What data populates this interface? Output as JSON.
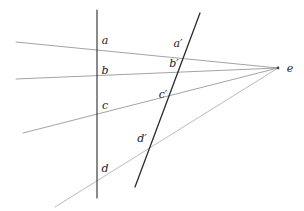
{
  "figure": {
    "background_color": "#ffffff",
    "width": 304,
    "height": 211,
    "ray_color": "#8c8c8c",
    "transversal_color": "#2b2b2b",
    "label_color": "#1a1a1a"
  },
  "vanishing_point": {
    "name": "e",
    "label": "e",
    "x": 278,
    "y": 68,
    "label_x": 290,
    "label_y": 68
  },
  "transversals": [
    {
      "name": "vertical-transversal",
      "x1": 97,
      "y1": 10,
      "x2": 97,
      "y2": 198,
      "color": "#2b2b2b",
      "width": 1.1
    },
    {
      "name": "oblique-transversal",
      "x1": 200,
      "y1": 13,
      "x2": 135,
      "y2": 187,
      "color": "#2b2b2b",
      "width": 1.3
    }
  ],
  "rays": [
    {
      "name": "ray-a",
      "x1": 16,
      "y1": 42,
      "x2": 278,
      "y2": 68,
      "color": "#8c8c8c",
      "width": 0.8
    },
    {
      "name": "ray-b",
      "x1": 16,
      "y1": 79,
      "x2": 278,
      "y2": 68,
      "color": "#8c8c8c",
      "width": 0.8
    },
    {
      "name": "ray-c",
      "x1": 23,
      "y1": 133,
      "x2": 278,
      "y2": 68,
      "color": "#8c8c8c",
      "width": 0.8
    },
    {
      "name": "ray-d",
      "x1": 55,
      "y1": 207,
      "x2": 278,
      "y2": 68,
      "color": "#a8a8a8",
      "width": 0.8
    }
  ],
  "labels": [
    {
      "name": "label-a",
      "text": "a",
      "x": 105,
      "y": 40
    },
    {
      "name": "label-b",
      "text": "b",
      "x": 105,
      "y": 70
    },
    {
      "name": "label-c",
      "text": "c",
      "x": 105,
      "y": 105
    },
    {
      "name": "label-d",
      "text": "d",
      "x": 105,
      "y": 168
    },
    {
      "name": "label-a-prime",
      "text": "a′",
      "x": 178,
      "y": 43
    },
    {
      "name": "label-b-prime",
      "text": "b′",
      "x": 174,
      "y": 63
    },
    {
      "name": "label-c-prime",
      "text": "c′",
      "x": 163,
      "y": 94
    },
    {
      "name": "label-d-prime",
      "text": "d′",
      "x": 142,
      "y": 138
    }
  ]
}
